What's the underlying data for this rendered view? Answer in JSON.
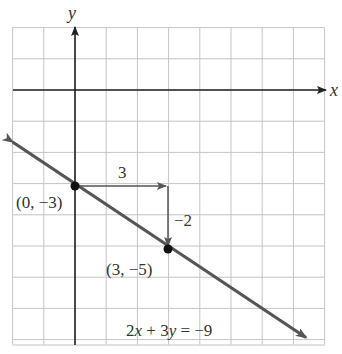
{
  "chart_data": {
    "type": "line",
    "title": "",
    "xlabel": "x",
    "ylabel": "y",
    "xlim": [
      -2,
      8
    ],
    "ylim": [
      -8,
      2
    ],
    "grid": true,
    "grid_step": 1,
    "series": [
      {
        "name": "2x + 3y = -9",
        "equation": "2x + 3y = -9",
        "slope": -0.6667,
        "intercept": -3,
        "x": [
          -2,
          7.4
        ],
        "y": [
          -1.667,
          -7.933
        ],
        "color": "#555555",
        "arrows": "both"
      }
    ],
    "points": [
      {
        "x": 0,
        "y": -3,
        "label": "(0, −3)"
      },
      {
        "x": 3,
        "y": -5,
        "label": "(3, −5)"
      }
    ],
    "annotations": [
      {
        "type": "run-arrow",
        "from": [
          0,
          -3
        ],
        "to": [
          3,
          -3
        ],
        "label": "3"
      },
      {
        "type": "rise-arrow",
        "from": [
          3,
          -3
        ],
        "to": [
          3,
          -5
        ],
        "label": "−2"
      },
      {
        "type": "equation-label",
        "text": "2x + 3y = −9"
      }
    ]
  },
  "labels": {
    "x_axis": "x",
    "y_axis": "y",
    "run": "3",
    "rise": "−2",
    "point1": "(0, −3)",
    "point2": "(3, −5)",
    "equation": "2x + 3y = −9"
  }
}
